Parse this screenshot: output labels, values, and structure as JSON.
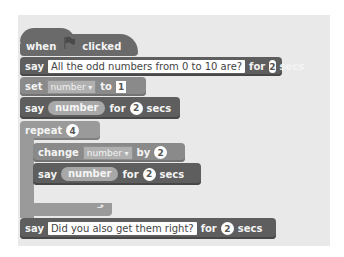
{
  "script": {
    "hat": {
      "when": "when",
      "icon": "green-flag-icon",
      "clicked": "clicked"
    },
    "block1": {
      "verb": "say",
      "message": "All the odd numbers from 0 to 10 are?",
      "for": "for",
      "secs_value": "2",
      "secs": "secs"
    },
    "block2": {
      "verb": "set",
      "variable": "number",
      "to": "to",
      "value": "1"
    },
    "block3": {
      "verb": "say",
      "reporter": "number",
      "for": "for",
      "secs_value": "2",
      "secs": "secs"
    },
    "repeat": {
      "label": "repeat",
      "count": "4",
      "loop_icon": "loop-arrow-icon",
      "inner": {
        "change": {
          "verb": "change",
          "variable": "number",
          "by": "by",
          "value": "2"
        },
        "say": {
          "verb": "say",
          "reporter": "number",
          "for": "for",
          "secs_value": "2",
          "secs": "secs"
        }
      }
    },
    "block_last": {
      "verb": "say",
      "message": "Did you also get them right?",
      "for": "for",
      "secs_value": "2",
      "secs": "secs"
    }
  },
  "colors": {
    "looks": "#5e5e5e",
    "control": "#9a9a9a",
    "data": "#8a8a8a",
    "panel": "#e9e9e9"
  }
}
